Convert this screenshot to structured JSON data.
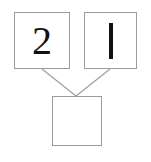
{
  "diagram": {
    "type": "number-bond",
    "background_color": "#ffffff",
    "border_color": "#9b9b9b",
    "ink_color": "#111111",
    "parts": [
      {
        "id": "addend-left",
        "label": "2",
        "value": 2,
        "glyph": "digit",
        "filled": true
      },
      {
        "id": "addend-right",
        "label": "1",
        "value": 1,
        "glyph": "vertical-stroke",
        "filled": true
      }
    ],
    "whole": {
      "id": "sum",
      "label": "",
      "value": null,
      "glyph": "blank",
      "filled": false
    },
    "connectors": [
      {
        "id": "connector-left",
        "from": "addend-left",
        "to": "sum"
      },
      {
        "id": "connector-right",
        "from": "addend-right",
        "to": "sum"
      }
    ]
  }
}
